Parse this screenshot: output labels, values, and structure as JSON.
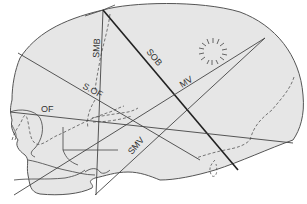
{
  "diagram": {
    "colors": {
      "fill": "#e6e6e6",
      "outline": "#555555",
      "line": "#444444",
      "bold_line": "#222222",
      "label": "#333333"
    },
    "labels": {
      "smb": "SMB",
      "sob": "SOB",
      "mv": "MV",
      "sof": "S.OF",
      "of": "OF",
      "smv": "SMV"
    },
    "features": {
      "fontanelle_burst": "radiating marks indicating anterior region of parietal bone",
      "dashed_contours": "sutures and orbital contour"
    }
  }
}
